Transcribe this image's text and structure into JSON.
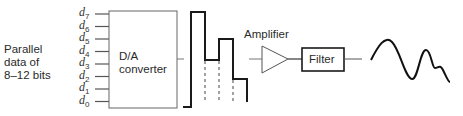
{
  "input_label": {
    "line1": "Parallel",
    "line2": "data of",
    "line3": "8–12 bits"
  },
  "bits": [
    {
      "name": "d",
      "sub": "7"
    },
    {
      "name": "d",
      "sub": "6"
    },
    {
      "name": "d",
      "sub": "5"
    },
    {
      "name": "d",
      "sub": "4"
    },
    {
      "name": "d",
      "sub": "3"
    },
    {
      "name": "d",
      "sub": "2"
    },
    {
      "name": "d",
      "sub": "1"
    },
    {
      "name": "d",
      "sub": "0"
    }
  ],
  "converter": {
    "line1": "D/A",
    "line2": "converter"
  },
  "amplifier": {
    "label": "Amplifier"
  },
  "filter": {
    "label": "Filter"
  },
  "colors": {
    "stroke": "#1a1a1a",
    "thin": "#555555"
  }
}
